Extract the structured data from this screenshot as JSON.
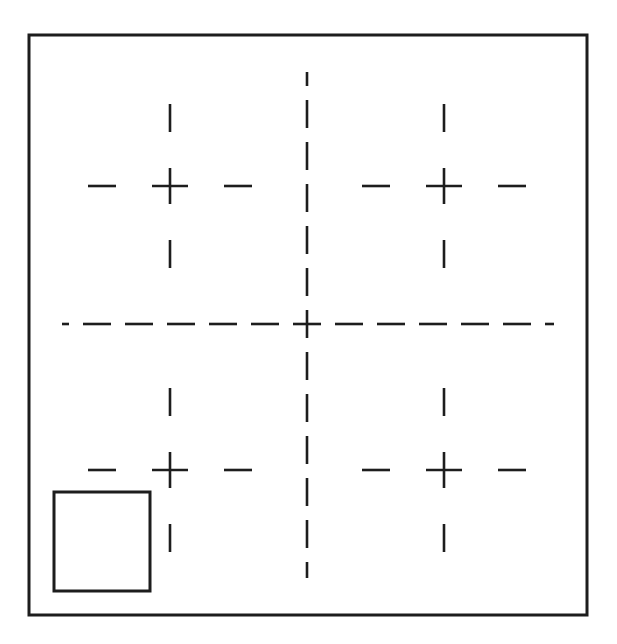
{
  "figure": {
    "canvas": {
      "width": 617,
      "height": 644,
      "background": "#ffffff"
    },
    "stroke": {
      "color": "#1d1d1d",
      "thin_width": 2.6,
      "frame_width": 3.0
    },
    "outer_frame": {
      "label": "outer-frame",
      "x": 29,
      "y": 35,
      "width": 558,
      "height": 580
    },
    "inner_square": {
      "label": "inner-square",
      "x": 54,
      "y": 492,
      "width": 96,
      "height": 99
    },
    "center_crosshair": {
      "label": "center-crosshair",
      "center_x": 307,
      "center_y": 324,
      "horizontal": {
        "x1": 62,
        "x2": 554,
        "y": 324
      },
      "vertical": {
        "y1": 72,
        "y2": 578,
        "x": 307
      },
      "dash_length": 28,
      "dash_gap": 14
    },
    "quadrant_marks": [
      {
        "label": "mark-top-left",
        "quadrant": "top-left",
        "center_x": 170,
        "center_y": 186,
        "cross_arm": 18,
        "dash_length": 28,
        "dash_offset": 54
      },
      {
        "label": "mark-top-right",
        "quadrant": "top-right",
        "center_x": 444,
        "center_y": 186,
        "cross_arm": 18,
        "dash_length": 28,
        "dash_offset": 54
      },
      {
        "label": "mark-bottom-left",
        "quadrant": "bottom-left",
        "center_x": 170,
        "center_y": 470,
        "cross_arm": 18,
        "dash_length": 28,
        "dash_offset": 54
      },
      {
        "label": "mark-bottom-right",
        "quadrant": "bottom-right",
        "center_x": 444,
        "center_y": 470,
        "cross_arm": 18,
        "dash_length": 28,
        "dash_offset": 54
      }
    ]
  }
}
